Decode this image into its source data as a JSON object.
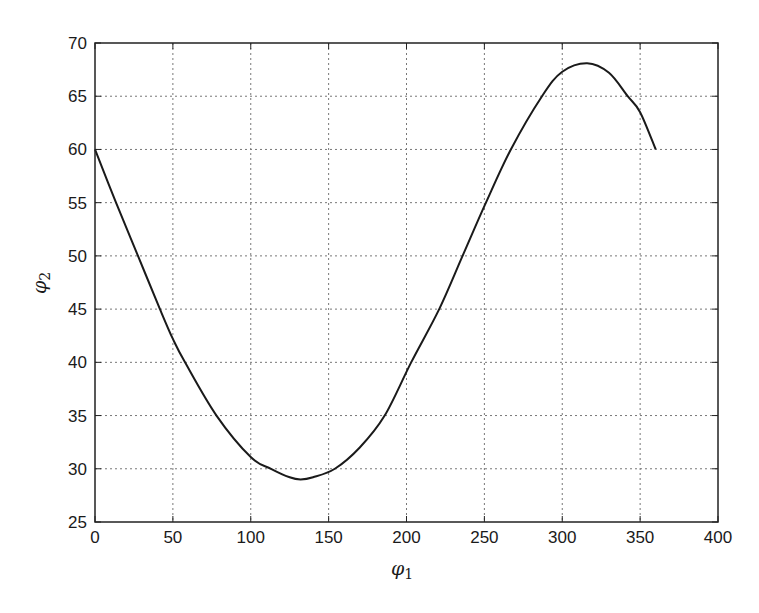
{
  "chart_data": {
    "type": "line",
    "title": "",
    "xlabel": "φ1",
    "ylabel": "φ2",
    "xlim": [
      0,
      400
    ],
    "ylim": [
      25,
      70
    ],
    "xticks": [
      0,
      50,
      100,
      150,
      200,
      250,
      300,
      350,
      400
    ],
    "yticks": [
      25,
      30,
      35,
      40,
      45,
      50,
      55,
      60,
      65,
      70
    ],
    "grid": true,
    "grid_style": "dotted",
    "legend": null,
    "series": [
      {
        "name": "φ2 vs φ1",
        "color": "#1a1a1a",
        "x": [
          0,
          13.5,
          27.6,
          41.7,
          50,
          57.8,
          78,
          100,
          113,
          125,
          132,
          140,
          154,
          170,
          186,
          203,
          221,
          236,
          251,
          267,
          287,
          300,
          316,
          330,
          342,
          350,
          360
        ],
        "y": [
          60,
          55,
          50,
          45,
          42.2,
          40,
          35,
          31.1,
          30,
          29.2,
          29.0,
          29.2,
          30,
          32,
          35,
          40,
          45,
          50,
          55,
          60,
          65,
          67.3,
          68.1,
          67.2,
          65,
          63.5,
          60
        ]
      }
    ]
  },
  "axes": {
    "x_label_main": "φ",
    "x_label_sub": "1",
    "y_label_main": "φ",
    "y_label_sub": "2"
  }
}
